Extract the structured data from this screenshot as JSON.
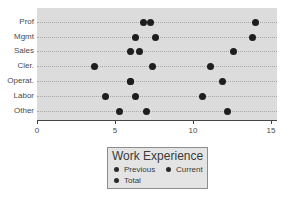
{
  "chart_data": {
    "type": "scatter",
    "subtype": "dot-plot",
    "title": "",
    "xlabel": "",
    "ylabel": "",
    "xlim": [
      0,
      15.5
    ],
    "x_ticks": [
      "0",
      "5",
      "10",
      "15"
    ],
    "categories": [
      "Prof",
      "Mgmt",
      "Sales",
      "Cler.",
      "Operat.",
      "Labor",
      "Other"
    ],
    "series": [
      {
        "name": "Previous",
        "values": [
          6.8,
          6.3,
          6.0,
          3.7,
          6.0,
          4.4,
          5.3
        ]
      },
      {
        "name": "Current",
        "values": [
          7.3,
          7.6,
          6.6,
          7.4,
          6.0,
          6.3,
          7.0
        ]
      },
      {
        "name": "Total",
        "values": [
          14.0,
          13.8,
          12.6,
          11.1,
          11.9,
          10.6,
          12.2
        ]
      }
    ],
    "legend": {
      "title": "Work Experience",
      "entries": [
        "Previous",
        "Current",
        "Total"
      ],
      "position": "bottom-center"
    },
    "grid": "dotted horizontal lines per category",
    "background": "#dcdcdc",
    "dot_color": "#1e1e1e"
  }
}
